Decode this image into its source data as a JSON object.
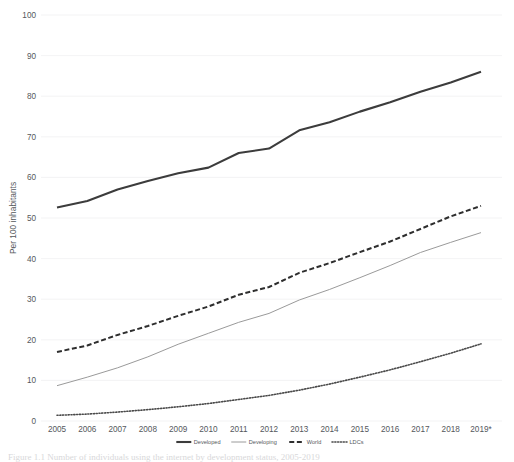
{
  "chart_data": {
    "type": "line",
    "title": "",
    "xlabel": "",
    "ylabel": "Per 100 inhabitants",
    "ylim": [
      0,
      100
    ],
    "yticks": [
      0,
      10,
      20,
      30,
      40,
      50,
      60,
      70,
      80,
      90,
      100
    ],
    "grid": true,
    "legend_position": "bottom",
    "categories": [
      "2005",
      "2006",
      "2007",
      "2008",
      "2009",
      "2010",
      "2011",
      "2012",
      "2013",
      "2014",
      "2015",
      "2016",
      "2017",
      "2018",
      "2019*"
    ],
    "series": [
      {
        "name": "Developed",
        "style": "solid-thick",
        "color": "#3c3c3c",
        "values": [
          52.6,
          54.2,
          57.0,
          59.1,
          61.0,
          62.4,
          66.0,
          67.1,
          71.6,
          73.6,
          76.2,
          78.5,
          81.1,
          83.4,
          86.0
        ]
      },
      {
        "name": "Developing",
        "style": "solid-thin",
        "color": "#9a9a9a",
        "values": [
          8.7,
          10.8,
          13.1,
          15.8,
          18.9,
          21.6,
          24.3,
          26.5,
          29.8,
          32.4,
          35.3,
          38.3,
          41.5,
          44.0,
          46.4
        ]
      },
      {
        "name": "World",
        "style": "dashed",
        "color": "#2e2e2e",
        "values": [
          17.0,
          18.6,
          21.2,
          23.4,
          25.9,
          28.2,
          31.1,
          33.0,
          36.5,
          38.9,
          41.6,
          44.2,
          47.3,
          50.4,
          53.0
        ]
      },
      {
        "name": "LDCs",
        "style": "dotted",
        "color": "#4a4a4a",
        "values": [
          1.4,
          1.7,
          2.2,
          2.8,
          3.5,
          4.3,
          5.3,
          6.3,
          7.6,
          9.1,
          10.8,
          12.6,
          14.6,
          16.7,
          19.0
        ]
      }
    ]
  },
  "caption": {
    "text": "Figure 1.1 Number of individuals using the internet by development status, 2005-2019"
  }
}
